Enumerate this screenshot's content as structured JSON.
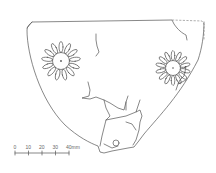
{
  "figure": {
    "scale_bar": {
      "ticks": [
        "0",
        "10",
        "20",
        "30",
        "40mm"
      ]
    },
    "colors": {
      "line": "#555555",
      "background": "#ffffff"
    }
  }
}
